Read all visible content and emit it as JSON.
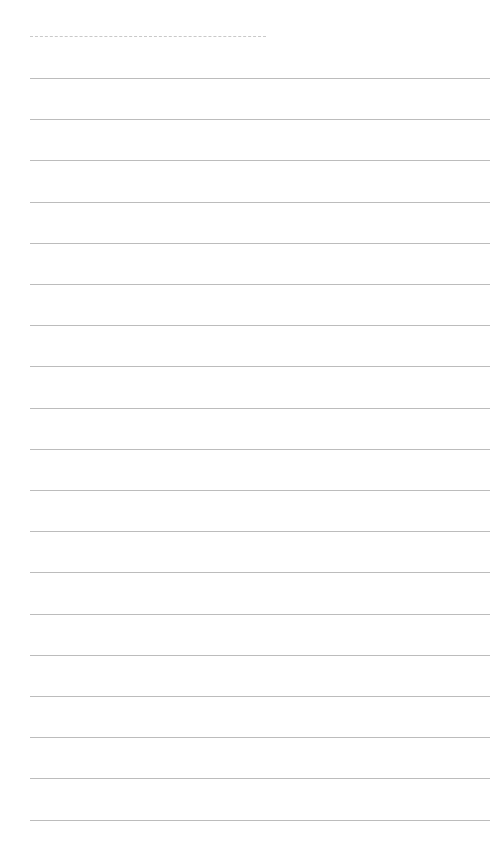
{
  "page": {
    "type": "lined-paper",
    "background": "#ffffff",
    "line_color": "#bcbcbc",
    "header_dashed_line_color": "#c9c9c9",
    "header_text": "",
    "rule_count": 19,
    "first_rule_y": 78,
    "rule_spacing": 41.2
  }
}
